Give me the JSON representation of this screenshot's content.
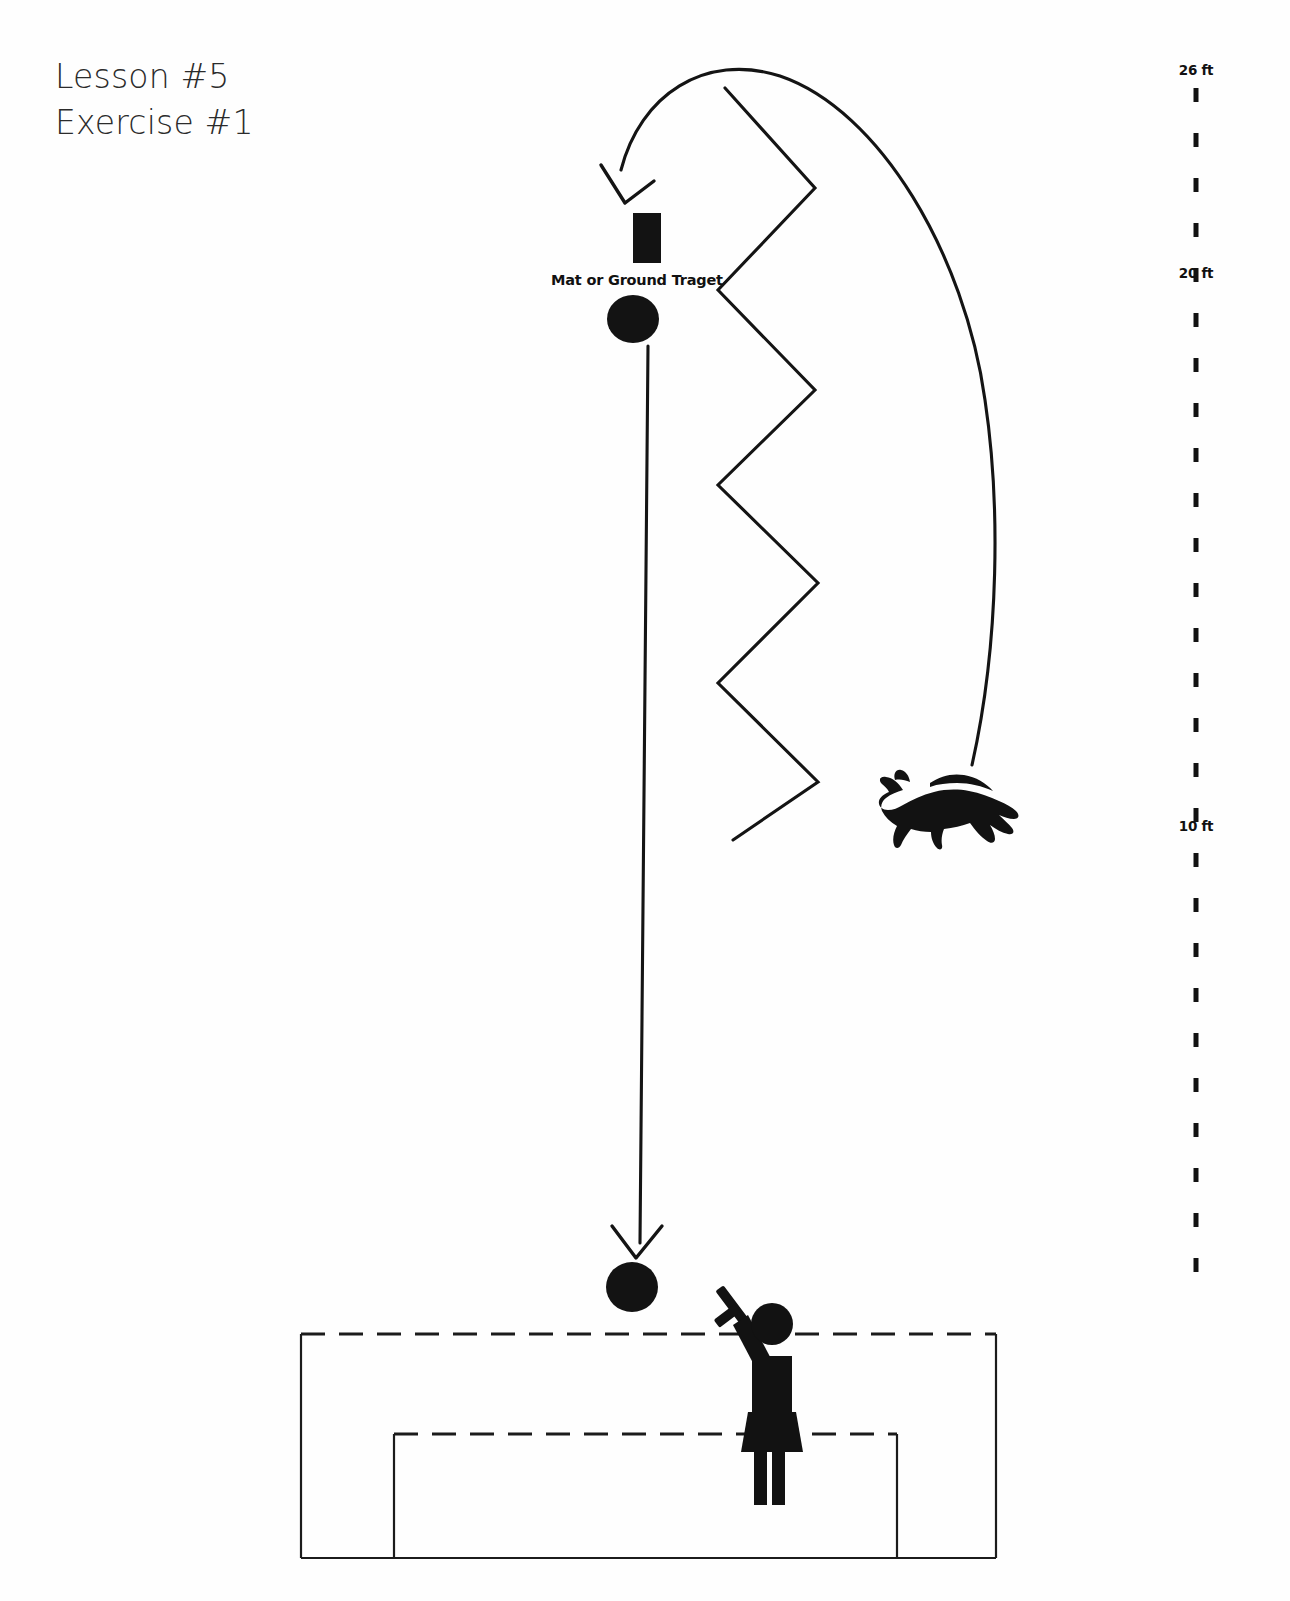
{
  "page": {
    "width": 1290,
    "height": 1601,
    "background": "#ffffff",
    "ink_color": "#111111"
  },
  "title": {
    "line1": "Lesson #5",
    "line2": "Exercise #1"
  },
  "labels": {
    "mat_target": "Mat or Ground Traget"
  },
  "ruler": {
    "orientation": "vertical",
    "x": 1196,
    "top": 62,
    "bottom": 1276,
    "dash_color": "#111111",
    "marks": [
      {
        "label": "26 ft",
        "y": 72
      },
      {
        "label": "20 ft",
        "y": 275
      },
      {
        "label": "10 ft",
        "y": 827
      }
    ]
  },
  "figures": {
    "mat": {
      "name": "mat-or-ground-target",
      "x": 633,
      "y": 213,
      "width": 28,
      "height": 50
    },
    "target_disc_top": {
      "name": "target-disc-upper",
      "cx": 633,
      "cy": 319,
      "rx": 26,
      "ry": 24
    },
    "target_disc_bottom": {
      "name": "target-disc-lower",
      "cx": 632,
      "cy": 1287,
      "rx": 26,
      "ry": 25
    },
    "dog": {
      "name": "dog-silhouette",
      "x": 880,
      "y": 768,
      "facing": "left"
    },
    "handler": {
      "name": "handler-figure",
      "x": 740,
      "y": 1305,
      "holding": "target-stick"
    }
  },
  "paths": {
    "curved_return": {
      "name": "dog-return-arc",
      "description": "arc from dog up and over, arrowhead down onto mat",
      "from": "dog",
      "to": "mat",
      "arrowhead": "at-mat"
    },
    "zigzag": {
      "name": "zigzag-path",
      "description": "zigzag weave line running down the centre",
      "points": "725,88 815,188 718,290 815,390 718,485 818,583 718,683 818,782 733,840"
    },
    "straight_down": {
      "name": "send-out-path",
      "description": "straight line from upper target disc down to lower target disc",
      "from_y": 346,
      "to_y": 1258,
      "x": 648,
      "arrowhead": "at-bottom"
    }
  },
  "ring": {
    "outer_box": {
      "name": "outer-ring-box",
      "left": 301,
      "top": 1334,
      "right": 996,
      "bottom": 1558,
      "top_edge": "dashed"
    },
    "inner_box": {
      "name": "inner-ring-box",
      "left": 394,
      "top": 1434,
      "right": 897,
      "bottom": 1558,
      "top_edge": "dashed"
    }
  }
}
